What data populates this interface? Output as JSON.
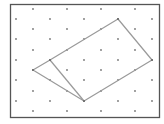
{
  "diagram": {
    "type": "dot-lattice-geometry",
    "frame": {
      "x": 10.5,
      "y": 4.5,
      "width": 149,
      "height": 113,
      "stroke": "#555555"
    },
    "lattice": {
      "dot_color": "#777777",
      "dot_radius": 0.9,
      "rows": [
        {
          "y": 9,
          "xs": [
            33,
            67,
            101,
            135
          ]
        },
        {
          "y": 19,
          "xs": [
            16,
            50,
            84,
            118,
            152
          ]
        },
        {
          "y": 29,
          "xs": [
            33,
            67,
            101,
            135
          ]
        },
        {
          "y": 39,
          "xs": [
            16,
            50,
            84,
            118,
            152
          ]
        },
        {
          "y": 50,
          "xs": [
            33,
            67,
            101,
            135
          ]
        },
        {
          "y": 60,
          "xs": [
            16,
            50,
            84,
            118,
            152
          ]
        },
        {
          "y": 70,
          "xs": [
            33,
            67,
            101,
            135
          ]
        },
        {
          "y": 80,
          "xs": [
            16,
            50,
            84,
            118,
            152
          ]
        },
        {
          "y": 91,
          "xs": [
            33,
            67,
            101,
            135
          ]
        },
        {
          "y": 101,
          "xs": [
            16,
            50,
            84,
            118,
            152
          ]
        },
        {
          "y": 111,
          "xs": [
            33,
            67,
            101,
            135
          ]
        }
      ]
    },
    "shape": {
      "stroke": "#9a9a9a",
      "stroke_width": 1.2,
      "outline": [
        [
          118,
          19
        ],
        [
          152,
          60
        ],
        [
          84,
          101
        ],
        [
          33,
          70
        ],
        [
          50,
          60
        ]
      ],
      "inner_segments": [
        [
          [
            50,
            60
          ],
          [
            84,
            101
          ]
        ]
      ]
    }
  }
}
